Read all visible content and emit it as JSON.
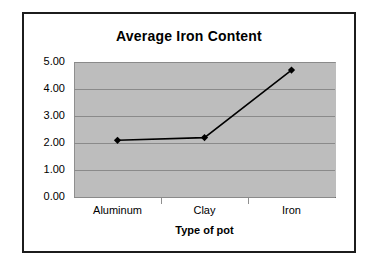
{
  "chart_data": {
    "type": "line",
    "title": "Average Iron Content",
    "xlabel": "Type of pot",
    "ylabel": "",
    "categories": [
      "Aluminum",
      "Clay",
      "Iron"
    ],
    "values": [
      2.1,
      2.2,
      4.7
    ],
    "series": [
      {
        "name": "Average Iron Content",
        "values": [
          2.1,
          2.2,
          4.7
        ]
      }
    ],
    "ylim": [
      0.0,
      5.0
    ],
    "ytick_labels": [
      "0.00",
      "1.00",
      "2.00",
      "3.00",
      "4.00",
      "5.00"
    ],
    "ytick_values": [
      0,
      1,
      2,
      3,
      4,
      5
    ],
    "grid": "horizontal",
    "legend": "none",
    "marker": "diamond",
    "line_color": "#000000",
    "marker_color": "#000000",
    "plot_background": "#bdbdbd",
    "gridline_color": "#8a8a8a",
    "figure_border_color": "#1c1c1c",
    "figure_background": "#ffffff"
  }
}
